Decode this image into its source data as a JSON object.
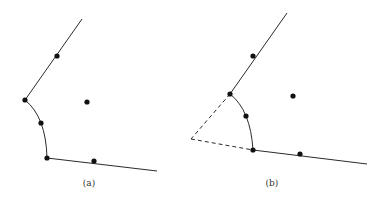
{
  "figure": {
    "panels": [
      {
        "id": "a",
        "label": "(a)",
        "label_pos": [
          89,
          186
        ],
        "upper_line": {
          "from": [
            82,
            19
          ],
          "to": [
            25,
            100
          ]
        },
        "arc": {
          "from": [
            25,
            100
          ],
          "via": [
            41,
            123
          ],
          "to": [
            47,
            158
          ]
        },
        "lower_line": {
          "from": [
            47,
            158
          ],
          "to": [
            157,
            171
          ]
        },
        "dashed_lines": [],
        "points": [
          {
            "name": "upper-line-point",
            "xy": [
              57,
              56
            ]
          },
          {
            "name": "upper-corner-point",
            "xy": [
              25,
              100
            ]
          },
          {
            "name": "interior-point",
            "xy": [
              87,
              102
            ]
          },
          {
            "name": "arc-mid-point",
            "xy": [
              41,
              123
            ]
          },
          {
            "name": "lower-corner-point",
            "xy": [
              47,
              158
            ]
          },
          {
            "name": "lower-line-point",
            "xy": [
              94,
              161
            ]
          }
        ]
      },
      {
        "id": "b",
        "label": "(b)",
        "label_pos": [
          272,
          186
        ],
        "upper_line": {
          "from": [
            287,
            13
          ],
          "to": [
            230,
            94
          ]
        },
        "arc": {
          "from": [
            230,
            94
          ],
          "via": [
            246,
            116
          ],
          "to": [
            253,
            150
          ]
        },
        "lower_line": {
          "from": [
            253,
            150
          ],
          "to": [
            367,
            164
          ]
        },
        "dashed_lines": [
          {
            "from": [
              230,
              94
            ],
            "to": [
              191,
              139
            ]
          },
          {
            "from": [
              191,
              139
            ],
            "to": [
              253,
              150
            ]
          }
        ],
        "points": [
          {
            "name": "upper-line-point",
            "xy": [
              253,
              56
            ]
          },
          {
            "name": "upper-corner-point",
            "xy": [
              230,
              94
            ]
          },
          {
            "name": "interior-point",
            "xy": [
              293,
              96
            ]
          },
          {
            "name": "arc-mid-point",
            "xy": [
              246,
              116
            ]
          },
          {
            "name": "lower-corner-point",
            "xy": [
              253,
              150
            ]
          },
          {
            "name": "lower-line-point",
            "xy": [
              300,
              154
            ]
          }
        ]
      }
    ],
    "colors": {
      "stroke": "#2b2b2b",
      "dot": "#111111",
      "label": "#333333"
    }
  }
}
